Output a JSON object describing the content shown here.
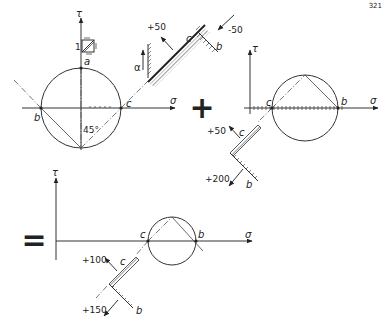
{
  "page_number": "321",
  "diagram1": {
    "tau_label": "τ",
    "sigma_label": "σ",
    "unit_label": "1",
    "point_a": "a",
    "point_b": "b",
    "point_c": "c",
    "angle_label": "45°",
    "element": {
      "alpha_label": "α",
      "face_c_label": "c",
      "face_b_label": "b",
      "stress_c": "+50",
      "stress_b": "-50"
    }
  },
  "plus_sign": "+",
  "diagram2": {
    "tau_label": "τ",
    "sigma_label": "σ",
    "point_c": "c",
    "point_b": "b",
    "element": {
      "face_c_label": "c",
      "face_b_label": "b",
      "stress_c": "+50",
      "stress_b": "+200"
    }
  },
  "equals_sign": "=",
  "diagram3": {
    "tau_label": "τ",
    "sigma_label": "σ",
    "point_c": "c",
    "point_b": "b",
    "element": {
      "face_c_label": "c",
      "face_b_label": "b",
      "stress_c": "+100",
      "stress_b": "+150"
    }
  }
}
